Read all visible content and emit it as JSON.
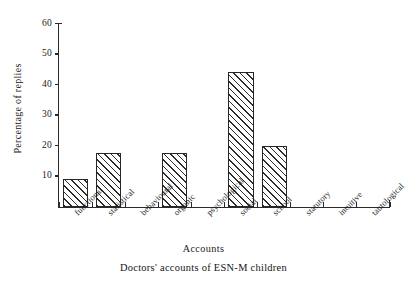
{
  "chart_data": {
    "type": "bar",
    "title": "",
    "caption": "Doctors' accounts of ESN-M children",
    "xlabel": "Accounts",
    "ylabel": "Percentage of replies",
    "categories": [
      "functional",
      "statistical",
      "behavioural",
      "organic",
      "psychological",
      "social",
      "school",
      "statutory",
      "intuitive",
      "tautological"
    ],
    "values": [
      9,
      17.7,
      0,
      17.7,
      0,
      44,
      20,
      0,
      0,
      0
    ],
    "ylim": [
      0,
      60
    ],
    "ytick_labels": [
      "10",
      "20",
      "30",
      "40",
      "50",
      "60"
    ],
    "ytick_values": [
      10,
      20,
      30,
      40,
      50,
      60
    ],
    "grid": false,
    "legend": false,
    "bar_fill": "diagonal-hatch",
    "colors": {
      "ink": "#262626",
      "background": "#ffffff"
    }
  }
}
